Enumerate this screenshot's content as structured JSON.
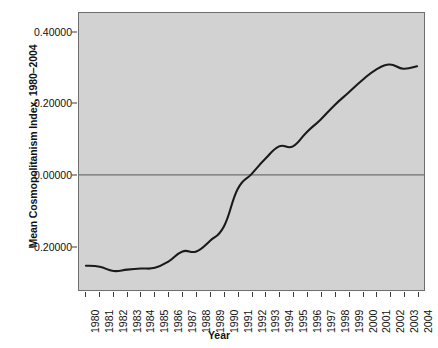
{
  "chart_data": {
    "type": "line",
    "title": "",
    "xlabel": "Year",
    "ylabel": "Mean Cosmopolitanism Index, 1980–2004",
    "x": [
      1980,
      1981,
      1982,
      1983,
      1984,
      1985,
      1986,
      1987,
      1988,
      1989,
      1990,
      1991,
      1992,
      1993,
      1994,
      1995,
      1996,
      1997,
      1998,
      1999,
      2000,
      2001,
      2002,
      2003,
      2004
    ],
    "categories": [
      "1980",
      "1981",
      "1982",
      "1983",
      "1984",
      "1985",
      "1986",
      "1987",
      "1988",
      "1989",
      "1990",
      "1991",
      "1992",
      "1993",
      "1994",
      "1995",
      "1996",
      "1997",
      "1998",
      "1999",
      "2000",
      "2001",
      "2002",
      "2003",
      "2004"
    ],
    "values": [
      -0.255,
      -0.258,
      -0.27,
      -0.266,
      -0.263,
      -0.261,
      -0.243,
      -0.215,
      -0.215,
      -0.185,
      -0.145,
      -0.04,
      0.002,
      0.045,
      0.08,
      0.08,
      0.12,
      0.155,
      0.195,
      0.23,
      0.265,
      0.295,
      0.31,
      0.298,
      0.305
    ],
    "series": [
      {
        "name": "Mean Cosmopolitanism Index",
        "values": [
          -0.255,
          -0.258,
          -0.27,
          -0.266,
          -0.263,
          -0.261,
          -0.243,
          -0.215,
          -0.215,
          -0.185,
          -0.145,
          -0.04,
          0.002,
          0.045,
          0.08,
          0.08,
          0.12,
          0.155,
          0.195,
          0.23,
          0.265,
          0.295,
          0.31,
          0.298,
          0.305
        ]
      }
    ],
    "yticks": [
      0.4,
      0.2,
      0.0,
      -0.2
    ],
    "ytick_labels": [
      "0.40000",
      "0.20000",
      "0.00000",
      "-0.20000"
    ],
    "ylim": [
      -0.3233,
      0.4545
    ],
    "xlim": [
      1979.5,
      2004.5
    ],
    "grid": false,
    "legend": false,
    "zero_line": 0.0,
    "colors": {
      "panel_background": "#d2d2d2",
      "line": "#1a1a1a",
      "zero_line": "#6e6e6e",
      "axis_text": "#111111",
      "panel_border": "#6e6e6e",
      "figure_background": "#ffffff"
    }
  }
}
